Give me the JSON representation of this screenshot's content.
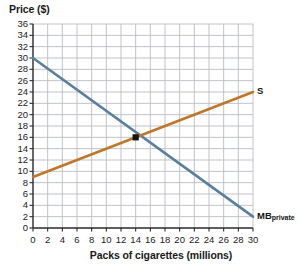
{
  "chart_data": {
    "type": "line",
    "title": "",
    "xlabel": "Packs of cigarettes (millions)",
    "ylabel": "Price ($)",
    "xlim": [
      0,
      30
    ],
    "ylim": [
      0,
      36
    ],
    "xticks": [
      0,
      2,
      4,
      6,
      8,
      10,
      12,
      14,
      16,
      18,
      20,
      22,
      24,
      26,
      28,
      30
    ],
    "yticks": [
      0,
      2,
      4,
      6,
      8,
      10,
      12,
      14,
      16,
      18,
      20,
      22,
      24,
      26,
      28,
      30,
      32,
      34,
      36
    ],
    "grid": true,
    "legend_position": "inline-end-of-line",
    "series": [
      {
        "name": "MBprivate",
        "label_text": "MB",
        "label_sub": "private",
        "color": "#5A7F9C",
        "kind": "demand",
        "points": [
          [
            0,
            30
          ],
          [
            30,
            2
          ]
        ]
      },
      {
        "name": "S",
        "label_text": "S",
        "label_sub": "",
        "color": "#C0762A",
        "kind": "supply",
        "points": [
          [
            0,
            9
          ],
          [
            30,
            24
          ]
        ]
      }
    ],
    "annotations": [
      {
        "name": "equilibrium-point",
        "marker": "square",
        "color": "#141414",
        "x": 14,
        "y": 16
      }
    ]
  },
  "axis": {
    "y_title": "Price ($)",
    "x_title": "Packs of cigarettes (millions)",
    "y_labels": [
      "36",
      "34",
      "32",
      "30",
      "28",
      "26",
      "24",
      "22",
      "20",
      "18",
      "16",
      "14",
      "12",
      "10",
      "8",
      "6",
      "4",
      "2",
      "0"
    ],
    "x_labels": [
      "0",
      "2",
      "4",
      "6",
      "8",
      "10",
      "12",
      "14",
      "16",
      "18",
      "20",
      "22",
      "24",
      "26",
      "28",
      "30"
    ]
  },
  "colors": {
    "demand_line": "#5A7F9C",
    "supply_line": "#C0762A",
    "grid": "#b9bcc4",
    "axis": "#2a2a2a",
    "text": "#1a1a1a",
    "marker": "#141414"
  }
}
